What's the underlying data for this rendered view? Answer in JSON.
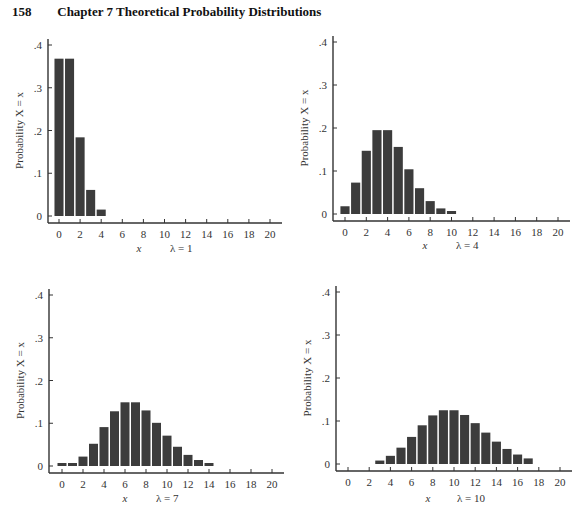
{
  "header": {
    "page_number": "158",
    "chapter_title": "Chapter 7   Theoretical Probability Distributions"
  },
  "chart_data": [
    {
      "type": "bar",
      "title": "λ = 1",
      "xlabel": "x",
      "ylabel": "Probability X = x",
      "lambda_label": "λ = 1",
      "x": [
        0,
        1,
        2,
        3,
        4
      ],
      "values": [
        0.368,
        0.368,
        0.184,
        0.061,
        0.015
      ],
      "xticks": [
        "0",
        "2",
        "4",
        "6",
        "8",
        "10",
        "12",
        "14",
        "16",
        "18",
        "20"
      ],
      "yticks": [
        "0",
        ".1",
        ".2",
        ".3",
        ".4"
      ],
      "xlim": [
        0,
        20
      ],
      "ylim": [
        0,
        0.4
      ],
      "grid": false,
      "panel": {
        "axis_x": 48,
        "zero_y": 216,
        "top_y": 45,
        "x0": 59,
        "x20": 270,
        "axis_y": 223,
        "label_y": 252,
        "xlab_x": 139,
        "lam_x": 170
      }
    },
    {
      "type": "bar",
      "title": "λ = 4",
      "xlabel": "x",
      "ylabel": "Probability X = x",
      "lambda_label": "λ = 4",
      "x": [
        0,
        1,
        2,
        3,
        4,
        5,
        6,
        7,
        8,
        9,
        10
      ],
      "values": [
        0.018,
        0.073,
        0.147,
        0.195,
        0.195,
        0.156,
        0.104,
        0.06,
        0.03,
        0.013,
        0.005
      ],
      "xticks": [
        "0",
        "2",
        "4",
        "6",
        "8",
        "10",
        "12",
        "14",
        "16",
        "18",
        "20"
      ],
      "yticks": [
        "0",
        ".1",
        ".2",
        ".3",
        ".4"
      ],
      "xlim": [
        0,
        20
      ],
      "ylim": [
        0,
        0.4
      ],
      "grid": false,
      "panel": {
        "axis_x": 333,
        "zero_y": 214,
        "top_y": 42,
        "x0": 345,
        "x20": 558,
        "axis_y": 221,
        "label_y": 249,
        "xlab_x": 425,
        "lam_x": 456
      }
    },
    {
      "type": "bar",
      "title": "λ = 7",
      "xlabel": "x",
      "ylabel": "Probability X = x",
      "lambda_label": "λ = 7",
      "x": [
        0,
        1,
        2,
        3,
        4,
        5,
        6,
        7,
        8,
        9,
        10,
        11,
        12,
        13,
        14
      ],
      "values": [
        0.001,
        0.006,
        0.022,
        0.052,
        0.091,
        0.128,
        0.149,
        0.149,
        0.13,
        0.101,
        0.071,
        0.045,
        0.026,
        0.014,
        0.007
      ],
      "xticks": [
        "0",
        "2",
        "4",
        "6",
        "8",
        "10",
        "12",
        "14",
        "16",
        "18",
        "20"
      ],
      "yticks": [
        "0",
        ".1",
        ".2",
        ".3",
        ".4"
      ],
      "xlim": [
        0,
        20
      ],
      "ylim": [
        0,
        0.4
      ],
      "grid": false,
      "panel": {
        "axis_x": 49,
        "zero_y": 466,
        "top_y": 295,
        "x0": 62,
        "x20": 272,
        "axis_y": 473,
        "label_y": 502,
        "xlab_x": 125,
        "lam_x": 156
      }
    },
    {
      "type": "bar",
      "title": "λ = 10",
      "xlabel": "x",
      "ylabel": "Probability X = x",
      "lambda_label": "λ = 10",
      "x": [
        3,
        4,
        5,
        6,
        7,
        8,
        9,
        10,
        11,
        12,
        13,
        14,
        15,
        16,
        17
      ],
      "values": [
        0.008,
        0.019,
        0.038,
        0.063,
        0.09,
        0.113,
        0.125,
        0.125,
        0.114,
        0.095,
        0.073,
        0.052,
        0.035,
        0.022,
        0.013
      ],
      "xticks": [
        "0",
        "2",
        "4",
        "6",
        "8",
        "10",
        "12",
        "14",
        "16",
        "18",
        "20"
      ],
      "yticks": [
        "0",
        ".1",
        ".2",
        ".3",
        ".4"
      ],
      "xlim": [
        0,
        20
      ],
      "ylim": [
        0,
        0.4
      ],
      "grid": false,
      "panel": {
        "axis_x": 336,
        "zero_y": 464,
        "top_y": 292,
        "x0": 348,
        "x20": 560,
        "axis_y": 471,
        "label_y": 502,
        "xlab_x": 428,
        "lam_x": 457
      }
    }
  ],
  "colors": {
    "bar": "#3c3c3c",
    "axis": "#333333",
    "background": "#ffffff"
  }
}
